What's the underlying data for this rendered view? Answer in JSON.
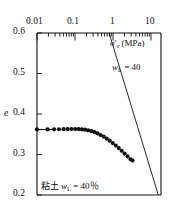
{
  "chart_data": {
    "type": "line",
    "title": "",
    "xlabel": "σ'v (MPa)",
    "ylabel": "e",
    "x_scale": "log",
    "xlim": [
      0.01,
      10
    ],
    "ylim": [
      0.2,
      0.6
    ],
    "x_ticklabels": [
      "0.01",
      "0.1",
      "1",
      "10"
    ],
    "x_tickvalues": [
      0.01,
      0.1,
      1,
      10
    ],
    "y_ticklabels": [
      "0.6",
      "0.5",
      "0.4",
      "0.3",
      "0.2"
    ],
    "y_tickvalues": [
      0.6,
      0.5,
      0.4,
      0.3,
      0.2
    ],
    "grid": false,
    "x_axis_position": "top",
    "series": [
      {
        "name": "measured-void-ratio",
        "style": "markers-with-leader-line",
        "marker": "filled-circle",
        "x": [
          0.01,
          0.018,
          0.026,
          0.034,
          0.044,
          0.055,
          0.068,
          0.084,
          0.102,
          0.122,
          0.145,
          0.172,
          0.205,
          0.245,
          0.292,
          0.345,
          0.41,
          0.485,
          0.575,
          0.68,
          0.805,
          0.95,
          1.12,
          1.32,
          1.56,
          1.84,
          2.05
        ],
        "y": [
          0.362,
          0.362,
          0.3622,
          0.3624,
          0.3626,
          0.3628,
          0.363,
          0.363,
          0.3628,
          0.3622,
          0.3612,
          0.3598,
          0.3578,
          0.3552,
          0.352,
          0.3482,
          0.344,
          0.3392,
          0.334,
          0.3282,
          0.3222,
          0.3158,
          0.3092,
          0.3022,
          0.2952,
          0.288,
          0.285
        ]
      },
      {
        "name": "normal-consolidation-line",
        "style": "straight-line",
        "label": "wL = 40",
        "x": [
          0.38,
          10.0
        ],
        "y": [
          0.6,
          0.2
        ]
      }
    ],
    "annotations": [
      {
        "name": "nc-line-label",
        "text": "w",
        "sub": "L",
        "rest": " = 40",
        "x_px": 112,
        "y_px": 68
      },
      {
        "name": "specimen-label",
        "jp": "粘土",
        "text": "w",
        "sub": "L",
        "rest": " = 40％",
        "x_px": 40,
        "y_px": 183
      }
    ]
  },
  "axes": {
    "x_label_main": "σ",
    "x_label_prime": "′",
    "x_label_sub": "v",
    "x_label_unit": " (MPa)",
    "y_label": "e"
  },
  "labels": {
    "x_ticks": [
      "0.01",
      "0.1",
      "1",
      "10"
    ],
    "y_ticks": [
      "0.6",
      "0.5",
      "0.4",
      "0.3",
      "0.2"
    ],
    "nc_line_w": "w",
    "nc_line_sub": "L",
    "nc_line_value": " = 40",
    "specimen_jp": "粘土",
    "specimen_w": "w",
    "specimen_sub": "L",
    "specimen_value": " = 40％"
  }
}
